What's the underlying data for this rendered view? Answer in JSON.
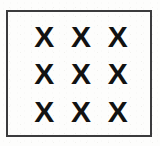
{
  "page": {
    "background_color": "#fdfdfc",
    "width": 160,
    "height": 146
  },
  "box": {
    "name": "bordered frame",
    "border_color": "#3b3b3d",
    "border_width_px": 2,
    "fill_color": "transparent"
  },
  "grid": {
    "rows": 3,
    "columns": 3,
    "glyph_color": "#121212",
    "cells": [
      [
        {
          "symbol": "X"
        },
        {
          "symbol": "X"
        },
        {
          "symbol": "X"
        }
      ],
      [
        {
          "symbol": "X"
        },
        {
          "symbol": "X"
        },
        {
          "symbol": "X"
        }
      ],
      [
        {
          "symbol": "X"
        },
        {
          "symbol": "X"
        },
        {
          "symbol": "X"
        }
      ]
    ]
  }
}
